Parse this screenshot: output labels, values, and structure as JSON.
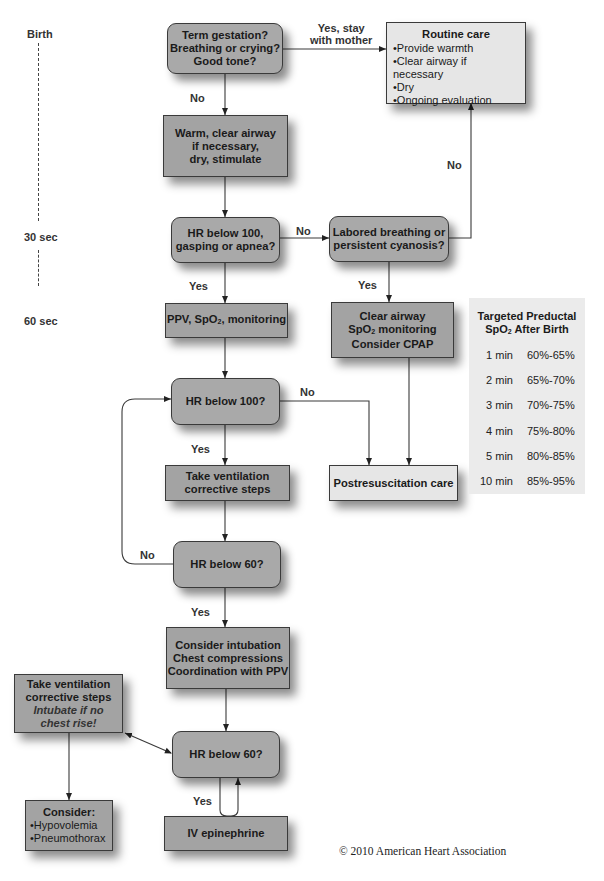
{
  "timeline": {
    "birth": "Birth",
    "t30": "30 sec",
    "t60": "60 sec"
  },
  "nodes": {
    "term_gestation": [
      "Term gestation?",
      "Breathing or crying?",
      "Good tone?"
    ],
    "routine_care": {
      "title": "Routine care",
      "items": [
        "Provide warmth",
        "Clear airway if necessary",
        "Dry",
        "Ongoing evaluation"
      ]
    },
    "warm_clear": [
      "Warm, clear airway",
      "if necessary,",
      "dry, stimulate"
    ],
    "hr_gasping": [
      "HR below 100,",
      "gasping or apnea?"
    ],
    "labored": [
      "Labored breathing or",
      "persistent cyanosis?"
    ],
    "ppv": {
      "pre": "PPV, SpO",
      "sub": "2",
      "post": ", monitoring"
    },
    "clear_airway": {
      "line1": "Clear airway",
      "line2_pre": "SpO",
      "line2_sub": "2",
      "line2_post": " monitoring",
      "line3": "Consider CPAP"
    },
    "hr_100": "HR below 100?",
    "take_vent": [
      "Take ventilation",
      "corrective steps"
    ],
    "postresus": "Postresuscitation care",
    "hr_60_a": "HR below 60?",
    "consider_intubation": [
      "Consider intubation",
      "Chest compressions",
      "Coordination with PPV"
    ],
    "take_vent_left": {
      "lines": [
        "Take ventilation",
        "corrective steps"
      ],
      "italic": [
        "Intubate if no",
        "chest rise!"
      ]
    },
    "hr_60_b": "HR below 60?",
    "consider": {
      "title": "Consider:",
      "items": [
        "Hypovolemia",
        "Pneumothorax"
      ]
    },
    "iv_epi": "IV epinephrine"
  },
  "edge_labels": {
    "yes_stay": [
      "Yes, stay",
      "with mother"
    ],
    "no_1": "No",
    "no_routine": "No",
    "no_gasping": "No",
    "yes_gasping": "Yes",
    "yes_labored": "Yes",
    "no_hr100": "No",
    "yes_hr100": "Yes",
    "no_hr60": "No",
    "yes_hr60": "Yes",
    "yes_epi": "Yes"
  },
  "spo2_table": {
    "title_line1": "Targeted Preductal",
    "title_line2_pre": "SpO",
    "title_line2_sub": "2",
    "title_line2_post": " After Birth",
    "rows": [
      {
        "time": "1 min",
        "range": "60%-65%"
      },
      {
        "time": "2 min",
        "range": "65%-70%"
      },
      {
        "time": "3 min",
        "range": "70%-75%"
      },
      {
        "time": "4 min",
        "range": "75%-80%"
      },
      {
        "time": "5 min",
        "range": "80%-85%"
      },
      {
        "time": "10 min",
        "range": "85%-95%"
      }
    ]
  },
  "copyright": "© 2010 American Heart Association",
  "colors": {
    "decision_fill": "#a9a9a9",
    "action_fill": "#a3a3a3",
    "light_fill": "#e6e6e6",
    "table_fill": "#ebebeb",
    "line": "#3a3a3a"
  }
}
